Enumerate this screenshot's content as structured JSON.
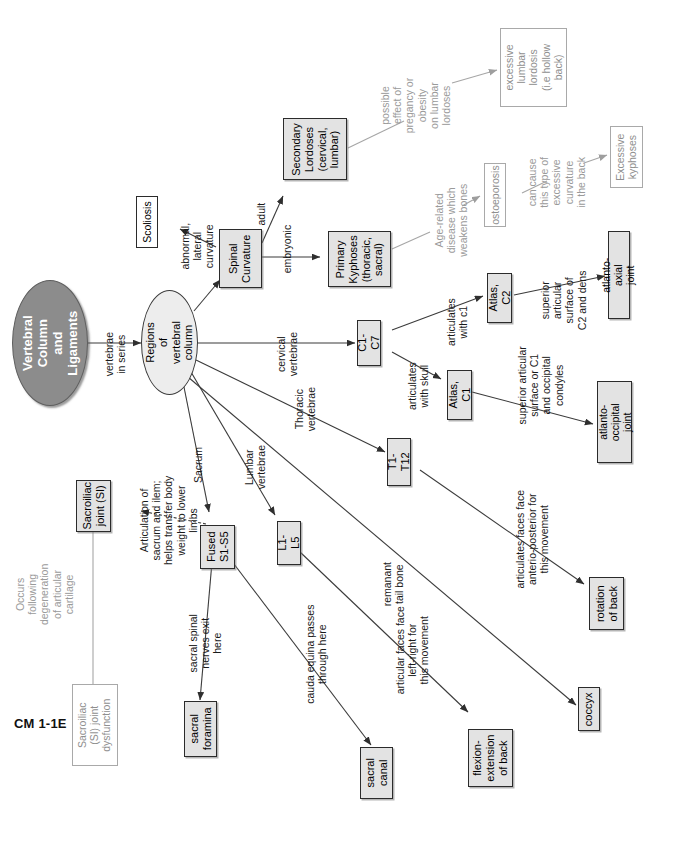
{
  "document": {
    "corner_tag": "CM 1-1E",
    "kind": "concept-map",
    "orientation": "text rotated 90 degrees counter-clockwise"
  },
  "palette": {
    "node_fill_gray": "#e3e3e3",
    "node_fill_white": "#ffffff",
    "root_fill": "#8c8c8c",
    "hub_fill": "#ededed",
    "stroke": "#2b2b2b",
    "faint_text": "#9a9a9a",
    "faint_stroke": "#a9a9a9"
  },
  "nodes": {
    "root": "Vertebral Column\nand Ligaments",
    "hub": "Regions\nof vertebral\ncolumn",
    "spinal_curvature": "Spinal\nCurvature",
    "scoliosis": "Scoliosis",
    "secondary_lordoses": "Secondary\nLordoses\n(cervical,\nlumbar)",
    "primary_kyphoses": "Primary\nKyphoses\n(thoracic,\nsacral)",
    "excessive_lumbar_lordosis": "excessive\nlumbar\nlordosis\n(i.e hollow\nback)",
    "osteoporosis": "ostoeporosis",
    "excessive_kyphoses": "Excessive\nkyphoses",
    "c1_c7": "C1-C7",
    "atlas_c2": "Atlas, C2",
    "atlas_c1": "Atlas, C1",
    "atlanto_axial_joint": "atlanto-axial joint",
    "atlanto_occipital_joint": "atlanto-occipital\njoint",
    "t1_t12": "T1-T12",
    "l1_l5": "L1-L5",
    "fused_s1_s5": "Fused\nS1-S5",
    "sacroiliac_joint": "Sacroiliac\njoint (SI)",
    "si_joint_dysfunction": "Sacroiliac\n(SI) joint\ndysfunction",
    "sacral_foramina": "sacral\nforamina",
    "sacral_canal": "sacral\ncanal",
    "flexion_extension": "flexion-\nextension\nof back",
    "rotation_of_back": "rotation\nof back",
    "coccyx": "coccyx"
  },
  "edge_labels": {
    "vertebrae_in_series": "vertebrae\nin series",
    "abnormal_lateral_curvature": "abnormal,\nlateral\ncurvature",
    "adult": "adult",
    "embryonic": "embryonic",
    "possible_effect": "possible\neffect of\npregancy or\nobesity\non lumbar\nlordoses",
    "age_related": "Age-related\ndisease which\nweakens bones",
    "can_cause": "can cause\nthis type of\nexcessive\ncurvature\nin the back",
    "cervical_vertebrae": "cervical\nvertebrae",
    "articulates_with_c1": "articulates\nwith c1",
    "articulates_with_skull": "articulates\nwith skull",
    "superior_articular_c2_dens": "superior articular\nsurface of\nC2 and dens",
    "superior_articular_c1_condyles": "superior articular\nsurface or C1\nand occipital condyles",
    "thoracic_vertebrae": "Thoracic\nvertebrae",
    "lumbar_vertebrae": "Lumbar\nvertebrae",
    "sacrum": "Sacrum",
    "articulation_of_sacrum": "Articulation of\nsacrum and ilem;\nhelps transfer body\nweight to lower limbs",
    "occurs_following": "Occurs\nfollowing\ndegeneration\nof articular\ncartilage",
    "sacral_spinal_nerves": "sacral spinal\nnerves exit\nhere",
    "cauda_equina": "cauda equina passes\nthrough here",
    "articular_faces_left_right": "articular faces face\nleft-right for\nthis movement",
    "articulates_faces_ap": "articulates faces face\nanterio-posterior for\nthis movement",
    "remanant_tail_bone": "remanant\ntail bone"
  }
}
